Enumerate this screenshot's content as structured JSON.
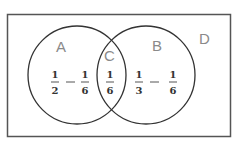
{
  "diagram": {
    "type": "venn",
    "universe_label": "D",
    "sets": [
      {
        "label": "A",
        "region_expression": {
          "term1": {
            "num": "1",
            "den": "2"
          },
          "operator": "−",
          "term2": {
            "num": "1",
            "den": "6"
          }
        }
      },
      {
        "label": "B",
        "region_expression": {
          "term1": {
            "num": "1",
            "den": "3"
          },
          "operator": "−",
          "term2": {
            "num": "1",
            "den": "6"
          }
        }
      }
    ],
    "intersection": {
      "label": "C",
      "value": {
        "num": "1",
        "den": "6"
      }
    },
    "colors": {
      "outline": "#333333",
      "label": "#8a8a8a",
      "text": "#333333"
    }
  }
}
